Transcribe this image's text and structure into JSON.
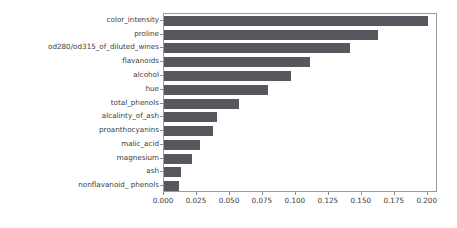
{
  "chart_data": {
    "type": "bar",
    "orientation": "horizontal",
    "title": "",
    "xlabel": "",
    "ylabel": "",
    "xlim": [
      0.0,
      0.2078
    ],
    "grid": false,
    "legend": null,
    "bar_color": "#57575d",
    "categories": [
      "color_intensity",
      "proline",
      "od280/od315_of_diluted_wines",
      "flavanoids",
      "alcohol",
      "hue",
      "total_phenols",
      "alcalinty_of_ash",
      "proanthocyanins",
      "malic_acid",
      "magnesium",
      "ash",
      "nonflavanoid_ phenols"
    ],
    "values": [
      0.2,
      0.162,
      0.141,
      0.111,
      0.096,
      0.079,
      0.057,
      0.04,
      0.037,
      0.027,
      0.021,
      0.013,
      0.011
    ],
    "xticks": [
      0.0,
      0.025,
      0.05,
      0.075,
      0.1,
      0.125,
      0.15,
      0.175,
      0.2
    ],
    "xticklabels": [
      "0.000",
      "0.025",
      "0.050",
      "0.075",
      "0.100",
      "0.125",
      "0.150",
      "0.175",
      "0.200"
    ]
  }
}
